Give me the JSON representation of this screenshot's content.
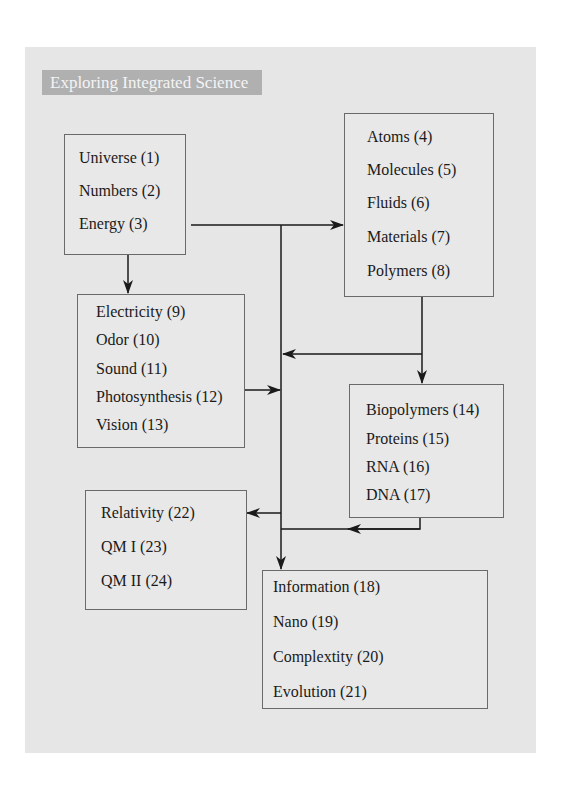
{
  "title": "Exploring Integrated Science",
  "colors": {
    "panel": "#e6e6e6",
    "title_bar": "#b0b0b0",
    "title_text": "#f4f4f4",
    "box_border": "#6a6a6a",
    "line": "#1a1a1a"
  },
  "boxes": {
    "foundations": {
      "items": [
        "Universe (1)",
        "Numbers (2)",
        "Energy (3)"
      ]
    },
    "matter": {
      "items": [
        "Atoms (4)",
        "Molecules (5)",
        "Fluids (6)",
        "Materials (7)",
        "Polymers (8)"
      ]
    },
    "phenomena": {
      "items": [
        "Electricity (9)",
        "Odor (10)",
        "Sound (11)",
        "Photosynthesis (12)",
        "Vision (13)"
      ]
    },
    "biology": {
      "items": [
        "Biopolymers (14)",
        "Proteins (15)",
        "RNA (16)",
        "DNA (17)"
      ]
    },
    "physics": {
      "items": [
        "Relativity (22)",
        "QM I (23)",
        "QM II (24)"
      ]
    },
    "synthesis": {
      "items": [
        "Information (18)",
        "Nano (19)",
        "Complextity (20)",
        "Evolution (21)"
      ]
    }
  }
}
